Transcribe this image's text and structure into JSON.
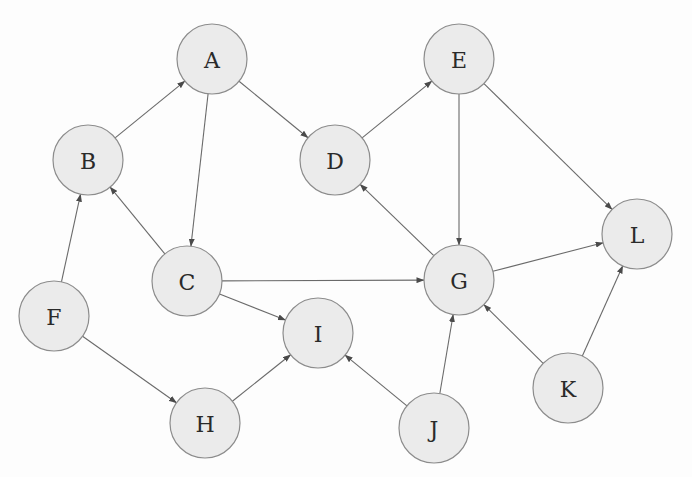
{
  "diagram": {
    "type": "directed-graph",
    "node_radius": 35,
    "colors": {
      "node_fill": "#ebebeb",
      "node_stroke": "#8c8c8c",
      "edge": "#6a6a6a",
      "label": "#2a2a2a",
      "background": "#fdfdfd"
    },
    "nodes": [
      {
        "id": "A",
        "label": "A",
        "x": 212,
        "y": 59
      },
      {
        "id": "B",
        "label": "B",
        "x": 88,
        "y": 160
      },
      {
        "id": "C",
        "label": "C",
        "x": 187,
        "y": 281
      },
      {
        "id": "D",
        "label": "D",
        "x": 335,
        "y": 160
      },
      {
        "id": "E",
        "label": "E",
        "x": 459,
        "y": 59
      },
      {
        "id": "F",
        "label": "F",
        "x": 54,
        "y": 316
      },
      {
        "id": "G",
        "label": "G",
        "x": 459,
        "y": 280
      },
      {
        "id": "H",
        "label": "H",
        "x": 205,
        "y": 423
      },
      {
        "id": "I",
        "label": "I",
        "x": 318,
        "y": 333
      },
      {
        "id": "J",
        "label": "J",
        "x": 434,
        "y": 428
      },
      {
        "id": "K",
        "label": "K",
        "x": 568,
        "y": 388
      },
      {
        "id": "L",
        "label": "L",
        "x": 637,
        "y": 234
      }
    ],
    "edges": [
      {
        "from": "B",
        "to": "A"
      },
      {
        "from": "A",
        "to": "D"
      },
      {
        "from": "A",
        "to": "C"
      },
      {
        "from": "C",
        "to": "B"
      },
      {
        "from": "F",
        "to": "B"
      },
      {
        "from": "D",
        "to": "E"
      },
      {
        "from": "E",
        "to": "G"
      },
      {
        "from": "E",
        "to": "L"
      },
      {
        "from": "G",
        "to": "D"
      },
      {
        "from": "C",
        "to": "G"
      },
      {
        "from": "C",
        "to": "I"
      },
      {
        "from": "F",
        "to": "H"
      },
      {
        "from": "H",
        "to": "I"
      },
      {
        "from": "J",
        "to": "I"
      },
      {
        "from": "J",
        "to": "G"
      },
      {
        "from": "G",
        "to": "L"
      },
      {
        "from": "K",
        "to": "G"
      },
      {
        "from": "K",
        "to": "L"
      }
    ]
  }
}
